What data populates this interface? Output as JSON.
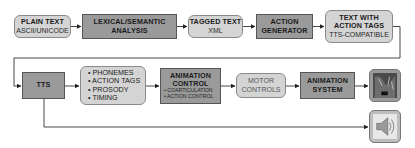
{
  "row1": [
    {
      "title": "PLAIN TEXT",
      "sub": "ASCII/UNICODE"
    },
    {
      "title": "LEXICAL/SEMANTIC",
      "title2": "ANALYSIS"
    },
    {
      "title": "TAGGED TEXT",
      "sub": "XML"
    },
    {
      "title": "ACTION",
      "title2": "GENERATOR"
    },
    {
      "title": "TEXT WITH",
      "title2": "ACTION TAGS",
      "sub": "TTS-COMPATIBLE"
    }
  ],
  "row2": {
    "tts": {
      "title": "TTS"
    },
    "outputs": {
      "items": [
        "• PHONEMES",
        "• ACTION TAGS",
        "• PROSODY",
        "• TIMING"
      ]
    },
    "animation_control": {
      "title": "ANIMATION",
      "title2": "CONTROL",
      "bullets": [
        "• COARTICULATION",
        "• ACTION CONTROL"
      ]
    },
    "motor_controls": {
      "title": "MOTOR",
      "title2": "CONTROLS"
    },
    "animation_system": {
      "title": "ANIMATION",
      "title2": "SYSTEM"
    }
  },
  "outputs_icons": {
    "animation": "animated-face-image-icon",
    "audio": "speaker-audio-icon"
  },
  "colors": {
    "light_box": "#d4d4d4",
    "dark_box": "#9a9a9a",
    "line": "#333333"
  }
}
